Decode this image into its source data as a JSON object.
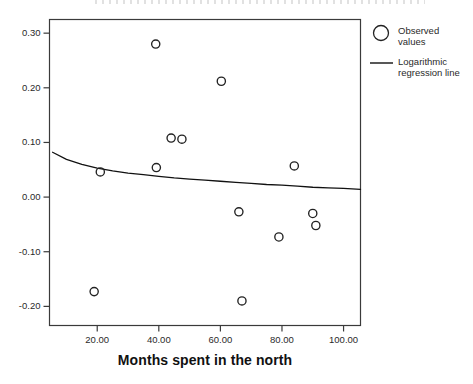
{
  "chart_data": {
    "type": "scatter",
    "title": "",
    "xlabel": "Months spent in the north",
    "ylabel": "",
    "xlim": [
      4.5,
      105.5
    ],
    "ylim": [
      -0.235,
      0.325
    ],
    "grid": false,
    "xticks": [
      20,
      40,
      60,
      80,
      100
    ],
    "xtick_labels": [
      "20.00",
      "40.00",
      "60.00",
      "80.00",
      "100.00"
    ],
    "yticks": [
      0.3,
      0.2,
      0.1,
      0.0,
      -0.1,
      -0.2
    ],
    "ytick_labels": [
      "0.30",
      "0.20",
      "0.10",
      "0.00",
      "-0.10",
      "-0.20"
    ],
    "series": [
      {
        "name": "Observed values",
        "type": "scatter",
        "marker": "open-circle",
        "color": "#222222",
        "points": [
          {
            "x": 19.0,
            "y": -0.173
          },
          {
            "x": 21.0,
            "y": 0.046
          },
          {
            "x": 39.0,
            "y": 0.28
          },
          {
            "x": 39.2,
            "y": 0.054
          },
          {
            "x": 44.0,
            "y": 0.108
          },
          {
            "x": 47.5,
            "y": 0.106
          },
          {
            "x": 60.3,
            "y": 0.212
          },
          {
            "x": 66.0,
            "y": -0.027
          },
          {
            "x": 67.0,
            "y": -0.19
          },
          {
            "x": 79.0,
            "y": -0.073
          },
          {
            "x": 84.0,
            "y": 0.057
          },
          {
            "x": 90.0,
            "y": -0.03
          },
          {
            "x": 91.0,
            "y": -0.052
          }
        ]
      },
      {
        "name": "Logarithmic regression line",
        "type": "line",
        "color": "#111111",
        "curve_points": [
          {
            "x": 5.5,
            "y": 0.082
          },
          {
            "x": 10.0,
            "y": 0.069
          },
          {
            "x": 15.0,
            "y": 0.06
          },
          {
            "x": 20.0,
            "y": 0.053
          },
          {
            "x": 25.0,
            "y": 0.048
          },
          {
            "x": 30.0,
            "y": 0.044
          },
          {
            "x": 35.0,
            "y": 0.041
          },
          {
            "x": 40.0,
            "y": 0.038
          },
          {
            "x": 45.0,
            "y": 0.035
          },
          {
            "x": 50.0,
            "y": 0.033
          },
          {
            "x": 55.0,
            "y": 0.031
          },
          {
            "x": 60.0,
            "y": 0.029
          },
          {
            "x": 65.0,
            "y": 0.027
          },
          {
            "x": 70.0,
            "y": 0.025
          },
          {
            "x": 75.0,
            "y": 0.023
          },
          {
            "x": 80.0,
            "y": 0.022
          },
          {
            "x": 85.0,
            "y": 0.02
          },
          {
            "x": 90.0,
            "y": 0.018
          },
          {
            "x": 95.0,
            "y": 0.017
          },
          {
            "x": 100.0,
            "y": 0.016
          },
          {
            "x": 105.5,
            "y": 0.014
          }
        ]
      }
    ]
  },
  "legend": {
    "position": "right",
    "entries": [
      {
        "label": "Observed\nvalues",
        "marker": "open-circle"
      },
      {
        "label": "Logarithmic\nregression line",
        "marker": "line"
      }
    ]
  },
  "axis": {
    "x_title": "Months spent in the north"
  }
}
